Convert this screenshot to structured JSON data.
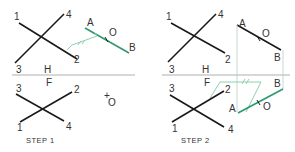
{
  "diagram": {
    "colors": {
      "line": "#1a1a1a",
      "accent": "#2e9a6e",
      "construction": "#8fcfae",
      "fold": "#b0b0b0",
      "projector": "#c8d8d0",
      "text": "#333333"
    },
    "fold_labels": {
      "top": "H",
      "bottom": "F"
    },
    "step1": {
      "caption": "STEP 1",
      "top_view": {
        "labels": [
          "1",
          "2",
          "3",
          "4",
          "A",
          "B",
          "O"
        ],
        "parallel_mark": "//"
      },
      "front_view": {
        "labels": [
          "3",
          "2",
          "1",
          "4",
          "O"
        ]
      }
    },
    "step2": {
      "caption": "STEP 2",
      "top_view": {
        "labels": [
          "1",
          "2",
          "3",
          "4",
          "A",
          "B",
          "O"
        ]
      },
      "front_view": {
        "labels": [
          "3",
          "2",
          "1",
          "4",
          "A",
          "B",
          "O"
        ],
        "parallel_mark": "//"
      }
    }
  }
}
